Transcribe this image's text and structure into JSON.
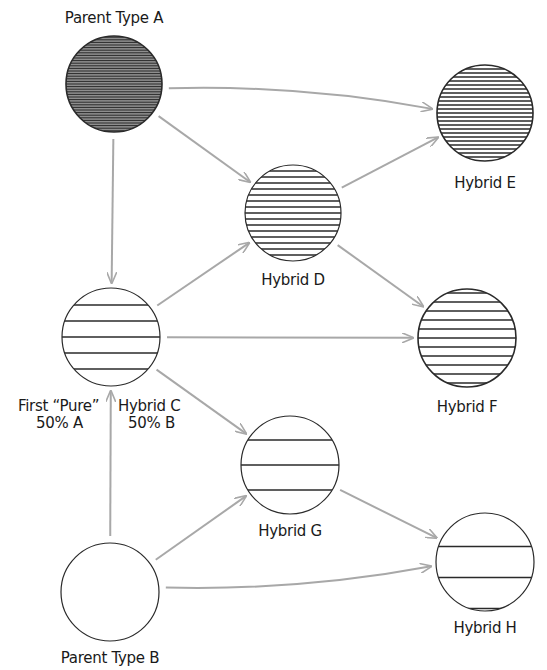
{
  "diagram": {
    "type": "hybridization-flow",
    "colors": {
      "arrow": "#a8a8a8",
      "outline": "#2a2a2a",
      "hatch": "#2a2a2a",
      "parent_a_fill": "#8a8a8a",
      "background": "#ffffff"
    },
    "nodes": [
      {
        "id": "A",
        "label": "Parent Type A",
        "cx": 114,
        "cy": 84,
        "r": 48,
        "hatch_spacing": 2.6,
        "fill": "#8e8e8e"
      },
      {
        "id": "E",
        "label": "Hybrid E",
        "cx": 485,
        "cy": 113,
        "r": 48,
        "hatch_spacing": 4,
        "fill": "#ffffff"
      },
      {
        "id": "D",
        "label": "Hybrid D",
        "cx": 293,
        "cy": 213,
        "r": 48,
        "hatch_spacing": 6,
        "fill": "#ffffff"
      },
      {
        "id": "C",
        "label_line1_left": "First “Pure”",
        "label_line1_right": "Hybrid C",
        "label_line2_left": "50% A",
        "label_line2_right": "50% B",
        "cx": 111,
        "cy": 337,
        "r": 49,
        "hatch_spacing": 16,
        "fill": "#ffffff"
      },
      {
        "id": "F",
        "label": "Hybrid F",
        "cx": 467,
        "cy": 338,
        "r": 49,
        "hatch_spacing": 9,
        "fill": "#ffffff"
      },
      {
        "id": "G",
        "label": "Hybrid G",
        "cx": 290,
        "cy": 465,
        "r": 49,
        "hatch_spacing": 25,
        "fill": "#ffffff"
      },
      {
        "id": "B",
        "label": "Parent Type B",
        "cx": 110,
        "cy": 592,
        "r": 49,
        "hatch_spacing": 0,
        "fill": "#ffffff"
      },
      {
        "id": "H",
        "label": "Hybrid H",
        "cx": 485,
        "cy": 562,
        "r": 49,
        "hatch_spacing": 31,
        "fill": "#ffffff"
      }
    ],
    "edges": [
      {
        "from": "A",
        "to": "E",
        "curved": true
      },
      {
        "from": "A",
        "to": "D",
        "curved": false
      },
      {
        "from": "A",
        "to": "C",
        "curved": false
      },
      {
        "from": "D",
        "to": "E",
        "curved": false
      },
      {
        "from": "D",
        "to": "F",
        "curved": false
      },
      {
        "from": "C",
        "to": "D",
        "curved": false
      },
      {
        "from": "C",
        "to": "F",
        "curved": false
      },
      {
        "from": "C",
        "to": "G",
        "curved": false
      },
      {
        "from": "B",
        "to": "C",
        "curved": false
      },
      {
        "from": "B",
        "to": "G",
        "curved": false
      },
      {
        "from": "B",
        "to": "H",
        "curved": true
      },
      {
        "from": "G",
        "to": "H",
        "curved": false
      }
    ]
  },
  "labels": {
    "parent_a": "Parent Type A",
    "hybrid_e": "Hybrid E",
    "hybrid_d": "Hybrid D",
    "hybrid_c_l1_left": "First “Pure”",
    "hybrid_c_l1_right": "Hybrid C",
    "hybrid_c_l2_left": "50% A",
    "hybrid_c_l2_right": "50% B",
    "hybrid_f": "Hybrid F",
    "hybrid_g": "Hybrid G",
    "parent_b": "Parent Type B",
    "hybrid_h": "Hybrid H"
  }
}
